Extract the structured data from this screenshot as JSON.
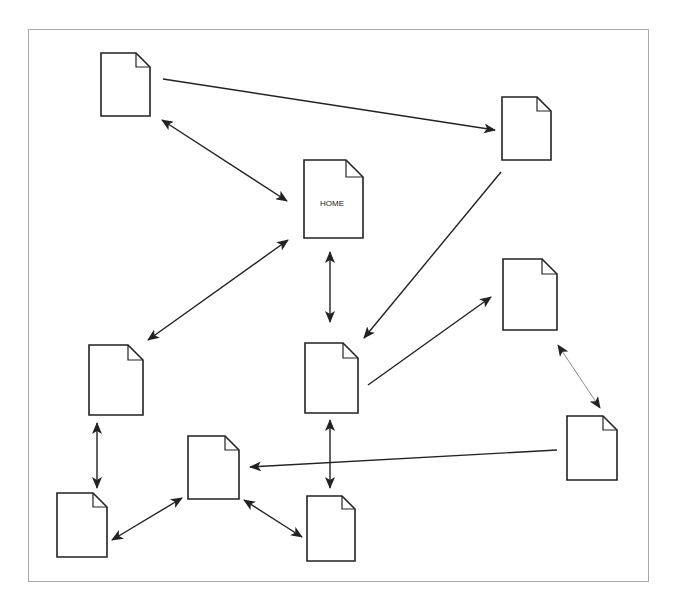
{
  "diagram": {
    "type": "site-map",
    "frame": {
      "x": 28,
      "y": 29,
      "w": 621,
      "h": 553,
      "border_color": "#a9a9a9"
    },
    "stroke_color": "#222222",
    "light_stroke_color": "#8a8a8a",
    "pages": [
      {
        "id": "p1",
        "label": "",
        "x": 101,
        "y": 53,
        "w": 49,
        "h": 63
      },
      {
        "id": "p2",
        "label": "",
        "x": 502,
        "y": 97,
        "w": 49,
        "h": 63
      },
      {
        "id": "home",
        "label": "HOME",
        "x": 304,
        "y": 160,
        "w": 59,
        "h": 78
      },
      {
        "id": "p4",
        "label": "",
        "x": 503,
        "y": 259,
        "w": 54,
        "h": 71
      },
      {
        "id": "p5",
        "label": "",
        "x": 89,
        "y": 345,
        "w": 54,
        "h": 70
      },
      {
        "id": "p6",
        "label": "",
        "x": 305,
        "y": 343,
        "w": 53,
        "h": 70
      },
      {
        "id": "p7",
        "label": "",
        "x": 567,
        "y": 416,
        "w": 50,
        "h": 64
      },
      {
        "id": "p8",
        "label": "",
        "x": 188,
        "y": 436,
        "w": 51,
        "h": 63
      },
      {
        "id": "p9",
        "label": "",
        "x": 57,
        "y": 493,
        "w": 50,
        "h": 64
      },
      {
        "id": "p10",
        "label": "",
        "x": 307,
        "y": 496,
        "w": 48,
        "h": 65
      }
    ],
    "links": [
      {
        "from": "p1",
        "to": "p2",
        "x1": 163,
        "y1": 79,
        "x2": 495,
        "y2": 130,
        "bidirectional": false
      },
      {
        "from": "p1",
        "to": "home",
        "x1": 162,
        "y1": 120,
        "x2": 287,
        "y2": 201,
        "bidirectional": true
      },
      {
        "from": "p2",
        "to": "p6",
        "x1": 501,
        "y1": 172,
        "x2": 364,
        "y2": 338,
        "bidirectional": false
      },
      {
        "from": "home",
        "to": "p5",
        "x1": 288,
        "y1": 240,
        "x2": 148,
        "y2": 340,
        "bidirectional": true
      },
      {
        "from": "home",
        "to": "p6",
        "x1": 330,
        "y1": 252,
        "x2": 330,
        "y2": 322,
        "bidirectional": true
      },
      {
        "from": "p6",
        "to": "p4",
        "x1": 368,
        "y1": 385,
        "x2": 491,
        "y2": 297,
        "bidirectional": false
      },
      {
        "from": "p4",
        "to": "p7",
        "x1": 558,
        "y1": 345,
        "x2": 600,
        "y2": 408,
        "bidirectional": true,
        "light": true
      },
      {
        "from": "p7",
        "to": "p8",
        "x1": 557,
        "y1": 450,
        "x2": 250,
        "y2": 467,
        "bidirectional": false
      },
      {
        "from": "p5",
        "to": "p9",
        "x1": 97,
        "y1": 423,
        "x2": 97,
        "y2": 488,
        "bidirectional": true
      },
      {
        "from": "p6",
        "to": "p10",
        "x1": 330,
        "y1": 420,
        "x2": 330,
        "y2": 488,
        "bidirectional": true
      },
      {
        "from": "p8",
        "to": "p9",
        "x1": 182,
        "y1": 498,
        "x2": 112,
        "y2": 540,
        "bidirectional": true
      },
      {
        "from": "p8",
        "to": "p10",
        "x1": 244,
        "y1": 500,
        "x2": 302,
        "y2": 537,
        "bidirectional": true
      }
    ]
  }
}
